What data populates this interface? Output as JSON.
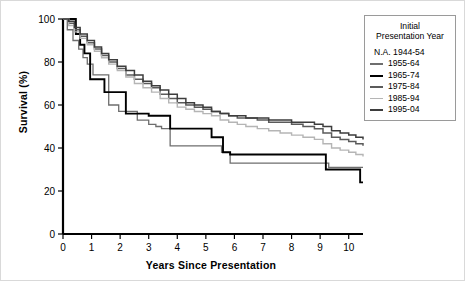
{
  "chart_data": {
    "type": "line",
    "title": "",
    "xlabel": "Years Since Presentation",
    "ylabel": "Survival (%)",
    "xlim": [
      0,
      10.5
    ],
    "ylim": [
      0,
      100
    ],
    "xticks": [
      0,
      1,
      2,
      3,
      4,
      5,
      6,
      7,
      8,
      9,
      10
    ],
    "yticks": [
      0,
      20,
      40,
      60,
      80,
      100
    ],
    "grid": false,
    "legend_position": "right-outside",
    "legend_title": "Initial Presentation Year",
    "step": "post",
    "series": [
      {
        "name": "N.A. 1944-54",
        "plotted": false,
        "color": "#000000",
        "width": 0,
        "x": [],
        "y": []
      },
      {
        "name": "1955-64",
        "plotted": true,
        "color": "#6e6e6e",
        "width": 1.3,
        "x": [
          0,
          0.15,
          0.35,
          0.55,
          0.7,
          0.85,
          1.05,
          1.15,
          1.6,
          1.95,
          2.35,
          2.6,
          3.0,
          3.25,
          3.45,
          3.75,
          3.85,
          4.4,
          4.9,
          5.25,
          5.55,
          5.85,
          6.4,
          7.1,
          7.8,
          8.5,
          9.0,
          9.3,
          9.7,
          10.1,
          10.3,
          10.5
        ],
        "y": [
          100,
          95,
          90,
          86,
          82,
          79,
          74,
          74,
          60,
          57,
          57,
          53,
          51,
          50,
          49,
          41,
          41,
          41,
          41,
          41,
          38,
          33,
          33,
          33,
          33,
          33,
          33,
          31,
          31,
          31,
          31,
          31
        ]
      },
      {
        "name": "1965-74",
        "plotted": true,
        "color": "#000000",
        "width": 1.9,
        "x": [
          0,
          0.2,
          0.45,
          0.6,
          0.75,
          0.95,
          1.05,
          1.15,
          1.3,
          1.45,
          1.65,
          1.95,
          2.2,
          2.6,
          3.0,
          3.4,
          3.75,
          3.85,
          4.4,
          4.85,
          5.2,
          5.45,
          5.6,
          5.85,
          6.4,
          7.1,
          7.8,
          8.5,
          9.0,
          9.2,
          9.6,
          10.0,
          10.25,
          10.4,
          10.5
        ],
        "y": [
          100,
          100,
          93,
          88,
          84,
          72,
          72,
          72,
          72,
          66,
          66,
          66,
          56,
          56,
          55,
          55,
          49,
          49,
          49,
          49,
          45,
          45,
          38,
          37,
          37,
          37,
          37,
          37,
          37,
          30,
          30,
          30,
          30,
          24,
          24
        ]
      },
      {
        "name": "1975-84",
        "plotted": true,
        "color": "#5b5b5b",
        "width": 1.5,
        "x": [
          0,
          0.2,
          0.4,
          0.6,
          0.85,
          1.1,
          1.35,
          1.6,
          1.9,
          2.2,
          2.5,
          2.8,
          3.1,
          3.4,
          3.7,
          4.0,
          4.3,
          4.6,
          4.9,
          5.2,
          5.5,
          5.8,
          6.1,
          6.4,
          6.8,
          7.2,
          7.6,
          8.0,
          8.4,
          8.8,
          9.1,
          9.4,
          9.7,
          10.0,
          10.25,
          10.5
        ],
        "y": [
          100,
          98,
          95,
          92,
          89,
          86,
          83,
          80,
          77,
          74,
          72,
          70,
          68,
          65,
          63,
          61,
          60,
          59,
          58,
          57,
          56,
          55,
          54,
          54,
          53,
          52,
          52,
          51,
          50,
          49,
          47,
          45,
          44,
          43,
          42,
          41
        ]
      },
      {
        "name": "1985-94",
        "plotted": true,
        "color": "#b5b5b5",
        "width": 1.4,
        "x": [
          0,
          0.2,
          0.4,
          0.6,
          0.85,
          1.1,
          1.35,
          1.6,
          1.9,
          2.2,
          2.5,
          2.8,
          3.1,
          3.4,
          3.7,
          4.0,
          4.3,
          4.6,
          4.9,
          5.2,
          5.5,
          5.8,
          6.1,
          6.4,
          6.8,
          7.2,
          7.6,
          8.0,
          8.4,
          8.8,
          9.1,
          9.4,
          9.7,
          10.0,
          10.25,
          10.5
        ],
        "y": [
          100,
          97,
          94,
          91,
          88,
          85,
          82,
          79,
          76,
          73,
          70,
          68,
          66,
          63,
          61,
          59,
          58,
          57,
          56,
          55,
          53,
          52,
          51,
          50,
          49,
          48,
          47,
          46,
          45,
          44,
          42,
          40,
          39,
          38,
          37,
          36
        ]
      },
      {
        "name": "1995-04",
        "plotted": true,
        "color": "#3d3d3d",
        "width": 1.5,
        "x": [
          0,
          0.2,
          0.4,
          0.6,
          0.85,
          1.1,
          1.35,
          1.6,
          1.9,
          2.2,
          2.5,
          2.8,
          3.1,
          3.4,
          3.7,
          4.0,
          4.3,
          4.6,
          4.9,
          5.2,
          5.5,
          5.8,
          6.1,
          6.4,
          6.8,
          7.2,
          7.6,
          8.0,
          8.4,
          8.8,
          9.1,
          9.4,
          9.7,
          10.0,
          10.25,
          10.5
        ],
        "y": [
          100,
          99,
          96,
          93,
          90,
          87,
          84,
          81,
          78,
          76,
          74,
          71,
          69,
          67,
          65,
          63,
          61,
          60,
          59,
          57,
          56,
          55,
          55,
          54,
          54,
          53,
          53,
          52,
          52,
          51,
          50,
          48,
          47,
          46,
          45,
          44
        ]
      }
    ]
  },
  "legend": {
    "title_line1": "Initial",
    "title_line2": "Presentation Year",
    "entries": [
      {
        "label": "N.A. 1944-54",
        "color": "#000000",
        "width": 0,
        "has_swatch": false
      },
      {
        "label": "1955-64",
        "color": "#6e6e6e",
        "width": 1.3,
        "has_swatch": true
      },
      {
        "label": "1965-74",
        "color": "#000000",
        "width": 2.2,
        "has_swatch": true
      },
      {
        "label": "1975-84",
        "color": "#5b5b5b",
        "width": 1.5,
        "has_swatch": true
      },
      {
        "label": "1985-94",
        "color": "#b5b5b5",
        "width": 1.4,
        "has_swatch": true
      },
      {
        "label": "1995-04",
        "color": "#3d3d3d",
        "width": 1.5,
        "has_swatch": true
      }
    ]
  },
  "axes": {
    "y_title": "Survival (%)",
    "x_title": "Years Since Presentation"
  }
}
